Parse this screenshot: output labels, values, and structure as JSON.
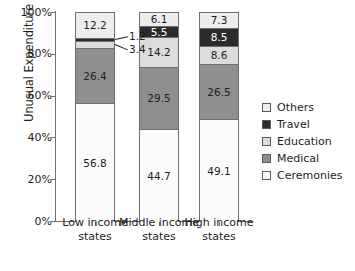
{
  "chart_data": {
    "type": "bar",
    "stacked": true,
    "title": "",
    "xlabel": "",
    "ylabel": "Unusual Expenditure",
    "ylim": [
      0,
      100
    ],
    "ytick_labels": [
      "100%",
      "80%",
      "60%",
      "40%",
      "20%",
      "0%"
    ],
    "ytick_values": [
      100,
      80,
      60,
      40,
      20,
      0
    ],
    "grid": false,
    "legend_position": "right",
    "categories": [
      "Low income states",
      "Middle income states",
      "High income states"
    ],
    "category_lines": [
      [
        "Low income",
        "states"
      ],
      [
        "Middle income",
        "states"
      ],
      [
        "High income",
        "states"
      ]
    ],
    "series": [
      {
        "name": "Ceremonies",
        "color": "#fbfbfb",
        "values": [
          56.8,
          44.7,
          49.1
        ]
      },
      {
        "name": "Medical",
        "color": "#8f8f8f",
        "values": [
          26.4,
          29.5,
          26.5
        ]
      },
      {
        "name": "Education",
        "color": "#dcdcdc",
        "values": [
          3.4,
          14.2,
          8.6
        ]
      },
      {
        "name": "Travel",
        "color": "#2b2b2b",
        "values": [
          1.2,
          5.5,
          8.5
        ]
      },
      {
        "name": "Others",
        "color": "#ededed",
        "values": [
          12.2,
          6.1,
          7.3
        ]
      }
    ],
    "legend_entries": [
      {
        "label": "Others",
        "color": "#ededed"
      },
      {
        "label": "Travel",
        "color": "#2b2b2b"
      },
      {
        "label": "Education",
        "color": "#dcdcdc"
      },
      {
        "label": "Medical",
        "color": "#8f8f8f"
      },
      {
        "label": "Ceremonies",
        "color": "#fbfbfb"
      }
    ],
    "callouts": [
      {
        "text": "1.2",
        "series": "Travel",
        "category": "Low income states"
      },
      {
        "text": "3.4",
        "series": "Education",
        "category": "Low income states"
      }
    ],
    "axis_color": "#6f6f6f",
    "text_color": "#1d1d1d"
  }
}
